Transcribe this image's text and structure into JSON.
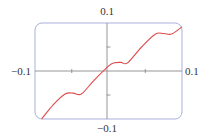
{
  "chart_data": {
    "type": "line",
    "title": "",
    "xlabel": "",
    "ylabel": "",
    "xlim": [
      -0.1,
      0.1
    ],
    "ylim": [
      -0.1,
      0.1
    ],
    "grid": false,
    "legend": null,
    "axis_labels": {
      "x_min": "−0.1",
      "x_max": "0.1",
      "y_min": "−0.1",
      "y_max": "0.1"
    },
    "ticks": {
      "x": [
        -0.05,
        0.05
      ],
      "y": [
        -0.05,
        0.05
      ]
    },
    "series": [
      {
        "name": "f(x)",
        "color": "#e04a4a",
        "x": [
          -0.091,
          -0.075,
          -0.059,
          -0.048,
          -0.037,
          -0.02,
          0.0,
          0.008,
          0.017,
          0.026,
          0.045,
          0.064,
          0.075,
          0.086,
          0.1
        ],
        "y": [
          -0.1,
          -0.07,
          -0.048,
          -0.046,
          -0.048,
          -0.02,
          0.01,
          0.017,
          0.018,
          0.017,
          0.05,
          0.077,
          0.078,
          0.077,
          0.092
        ]
      }
    ]
  },
  "colors": {
    "frame": "#a9b0dc",
    "axes": "#8a8a8a",
    "curve": "#e04a4a"
  }
}
